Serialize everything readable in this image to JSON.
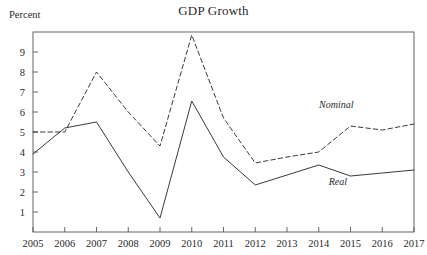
{
  "figure": {
    "title": "GDP Growth",
    "ylabel_text": "Percent",
    "real_label": "Real",
    "nominal_label": "Nominal"
  },
  "chart_data": {
    "type": "line",
    "title": "GDP Growth",
    "xlabel": "",
    "ylabel": "Percent",
    "x": [
      2005,
      2006,
      2007,
      2008,
      2009,
      2010,
      2011,
      2012,
      2013,
      2014,
      2015,
      2016,
      2017
    ],
    "xtick_labels": [
      "2005",
      "2006",
      "2007",
      "2008",
      "2009",
      "2010",
      "2011",
      "2012",
      "2013",
      "2014",
      "2015",
      "2016",
      "2017"
    ],
    "ytick_labels": [
      "1",
      "2",
      "3",
      "4",
      "5",
      "6",
      "7",
      "8",
      "9"
    ],
    "yticks": [
      1,
      2,
      3,
      4,
      5,
      6,
      7,
      8,
      9
    ],
    "ylim": [
      0,
      10
    ],
    "xlim": [
      2005,
      2017
    ],
    "grid": false,
    "legend_position": "inline-annotation",
    "series": [
      {
        "name": "Nominal",
        "style": "dashed",
        "color": "#3a3a3a",
        "values": [
          5.0,
          5.0,
          8.0,
          6.0,
          4.3,
          9.85,
          5.7,
          3.45,
          3.75,
          4.0,
          5.3,
          5.1,
          5.4
        ]
      },
      {
        "name": "Real",
        "style": "solid",
        "color": "#3a3a3a",
        "values": [
          3.9,
          5.2,
          5.5,
          3.0,
          0.7,
          6.55,
          3.75,
          2.35,
          2.85,
          3.35,
          2.8,
          2.95,
          3.1
        ]
      }
    ],
    "annotations": [
      {
        "text": "Nominal",
        "x": 2014.55,
        "y": 6.2
      },
      {
        "text": "Real",
        "x": 2014.6,
        "y": 2.35
      }
    ]
  },
  "colors": {
    "axis": "#555555",
    "line": "#3a3a3a",
    "text": "#2a2a2a",
    "background": "#ffffff"
  }
}
